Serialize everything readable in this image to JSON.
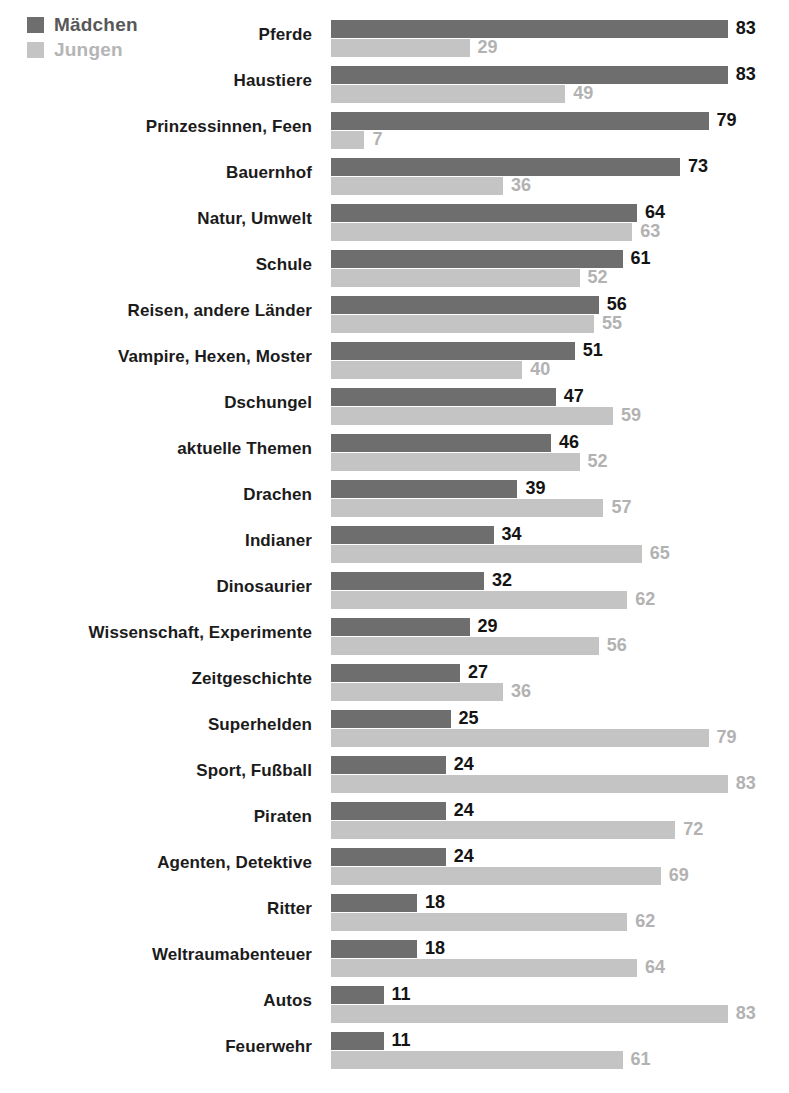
{
  "legend": {
    "items": [
      {
        "label": "Mädchen",
        "color": "#6e6e6e",
        "key": "girls"
      },
      {
        "label": "Jungen",
        "color": "#c4c4c4",
        "key": "boys"
      }
    ]
  },
  "chart_data": {
    "type": "bar",
    "orientation": "horizontal",
    "grouped": true,
    "title": "",
    "xlabel": "",
    "ylabel": "",
    "xlim": [
      0,
      100
    ],
    "grid": false,
    "legend_position": "top-left",
    "unit": "%",
    "categories": [
      "Pferde",
      "Haustiere",
      "Prinzessinnen, Feen",
      "Bauernhof",
      "Natur, Umwelt",
      "Schule",
      "Reisen, andere Länder",
      "Vampire, Hexen, Moster",
      "Dschungel",
      "aktuelle Themen",
      "Drachen",
      "Indianer",
      "Dinosaurier",
      "Wissenschaft, Experimente",
      "Zeitgeschichte",
      "Superhelden",
      "Sport, Fußball",
      "Piraten",
      "Agenten, Detektive",
      "Ritter",
      "Weltraumabenteuer",
      "Autos",
      "Feuerwehr"
    ],
    "series": [
      {
        "name": "Mädchen",
        "color": "#6e6e6e",
        "values": [
          83,
          83,
          79,
          73,
          64,
          61,
          56,
          51,
          47,
          46,
          39,
          34,
          32,
          29,
          27,
          25,
          24,
          24,
          24,
          18,
          18,
          11,
          11
        ]
      },
      {
        "name": "Jungen",
        "color": "#c4c4c4",
        "values": [
          29,
          49,
          7,
          36,
          63,
          52,
          55,
          40,
          59,
          52,
          57,
          65,
          62,
          56,
          36,
          79,
          83,
          72,
          69,
          62,
          64,
          83,
          61
        ]
      }
    ]
  }
}
